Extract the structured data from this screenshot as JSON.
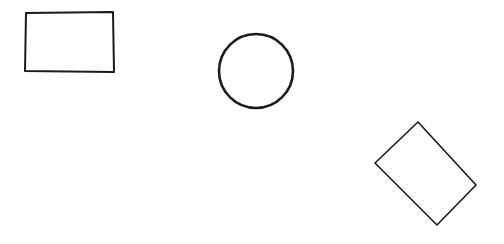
{
  "diagram": {
    "title": "",
    "background_color": "#ffffff",
    "stroke_color": "#1a1a1a",
    "shapes": [
      {
        "id": "rectangle",
        "kind": "rectangle",
        "label": ""
      },
      {
        "id": "circle",
        "kind": "circle",
        "label": ""
      },
      {
        "id": "rotated-rectangle",
        "kind": "rotated-rectangle",
        "label": ""
      }
    ]
  }
}
